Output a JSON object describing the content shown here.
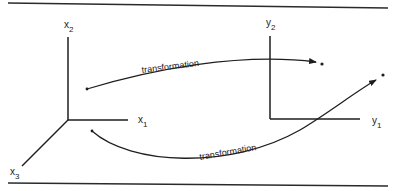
{
  "diagram": {
    "left_axes": {
      "x1_label": "x",
      "x1_sub": "1",
      "x2_label": "x",
      "x2_sub": "2",
      "x3_label": "x",
      "x3_sub": "3"
    },
    "right_axes": {
      "y1_label": "y",
      "y1_sub": "1",
      "y2_label": "y",
      "y2_sub": "2"
    },
    "arrows": [
      {
        "label": "transformation",
        "direction": "left-to-right upper"
      },
      {
        "label": "transformation",
        "direction": "left-to-right lower"
      }
    ],
    "colors": {
      "line": "#1e1e1e",
      "background": "#ffffff"
    }
  }
}
